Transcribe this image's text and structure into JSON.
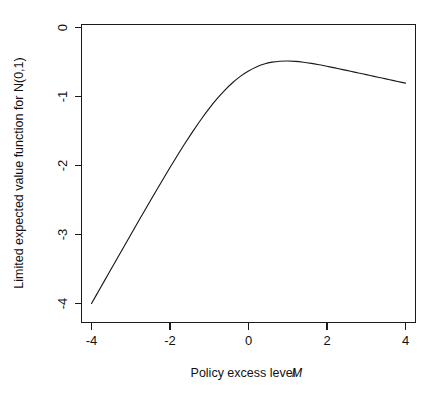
{
  "chart_data": {
    "type": "line",
    "title": "",
    "subtitle": "",
    "xlabel": "Policy excess level M",
    "xlabel_plain": "Policy excess level",
    "xlabel_italic_symbol": "M",
    "ylabel": "Limited expected value function for N(0,1)",
    "xlim": [
      -4.3,
      4.3
    ],
    "ylim": [
      -4.18,
      0.12
    ],
    "xticks": [
      -4,
      -2,
      0,
      2,
      4
    ],
    "xtick_labels": [
      "-4",
      "-2",
      "0",
      "2",
      "4"
    ],
    "yticks": [
      0,
      -1,
      -2,
      -3,
      -4
    ],
    "ytick_labels": [
      "0",
      "-1",
      "-2",
      "-3",
      "-4"
    ],
    "grid": false,
    "legend": null,
    "legend_position": "none",
    "box": "full",
    "line_color": "#1a1a1a",
    "background_color": "#ffffff",
    "series": [
      {
        "name": "Limited expected value for N(0,1)",
        "formula": "E[min(X,M)] = M*Phi(M) - phi(M)",
        "x": [
          -4.0,
          -3.8,
          -3.6,
          -3.4,
          -3.2,
          -3.0,
          -2.8,
          -2.6,
          -2.4,
          -2.2,
          -2.0,
          -1.8,
          -1.6,
          -1.4,
          -1.2,
          -1.0,
          -0.8,
          -0.6,
          -0.4,
          -0.2,
          0.0,
          0.2,
          0.4,
          0.6,
          0.8,
          1.0,
          1.2,
          1.4,
          1.6,
          1.8,
          2.0,
          2.2,
          2.4,
          2.6,
          2.8,
          3.0,
          3.2,
          3.4,
          3.6,
          3.8,
          4.0
        ],
        "values": [
          -4.0003,
          -3.8004,
          -3.6007,
          -3.4012,
          -3.202,
          -3.0033,
          -2.8054,
          -2.6085,
          -2.4132,
          -2.22,
          -2.0299,
          -1.8439,
          -1.6636,
          -1.4904,
          -1.3262,
          -1.1729,
          -1.0325,
          -0.9068,
          -0.7972,
          -0.7046,
          -0.6294,
          -0.5713,
          -0.5296,
          -0.5027,
          -0.4888,
          -0.4858,
          -0.4914,
          -0.5035,
          -0.5203,
          -0.5403,
          -0.5623,
          -0.5856,
          -0.6097,
          -0.6341,
          -0.6587,
          -0.6833,
          -0.708,
          -0.7326,
          -0.7572,
          -0.7818,
          -0.8064
        ]
      }
    ]
  },
  "axes": {
    "x_axis_name": "x-axis",
    "y_axis_name": "y-axis"
  }
}
